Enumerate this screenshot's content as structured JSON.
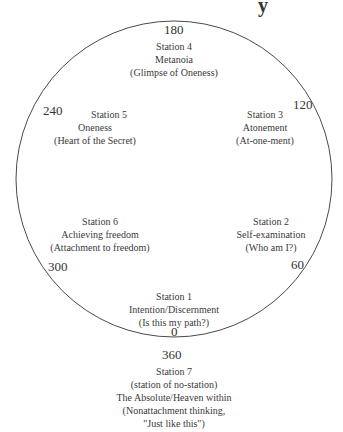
{
  "fragment_text": "y",
  "stations": [
    {
      "degree": "0",
      "lines": [
        "Station 1",
        "Intention/Discernment",
        "(Is this my path?)"
      ]
    },
    {
      "degree": "60",
      "lines": [
        "Station 2",
        "Self-examination",
        "(Who am I?)"
      ]
    },
    {
      "degree": "120",
      "lines": [
        "Station 3",
        "Atonement",
        "(At-one-ment)"
      ]
    },
    {
      "degree": "180",
      "lines": [
        "Station 4",
        "Metanoia",
        "(Glimpse of Oneness)"
      ]
    },
    {
      "degree": "240",
      "lines": [
        "Station 5",
        "Oneness",
        "(Heart of the Secret)"
      ]
    },
    {
      "degree": "300",
      "lines": [
        "Station 6",
        "Achieving freedom",
        "(Attachment to freedom)"
      ]
    },
    {
      "degree": "360",
      "lines": [
        "Station 7",
        "(station of no-station)",
        "The Absolute/Heaven within",
        "(Nonattachment thinking,",
        "\"Just like this\")"
      ]
    }
  ],
  "colors": {
    "circle": "#4a4a4a",
    "text": "#3a3a3a"
  }
}
